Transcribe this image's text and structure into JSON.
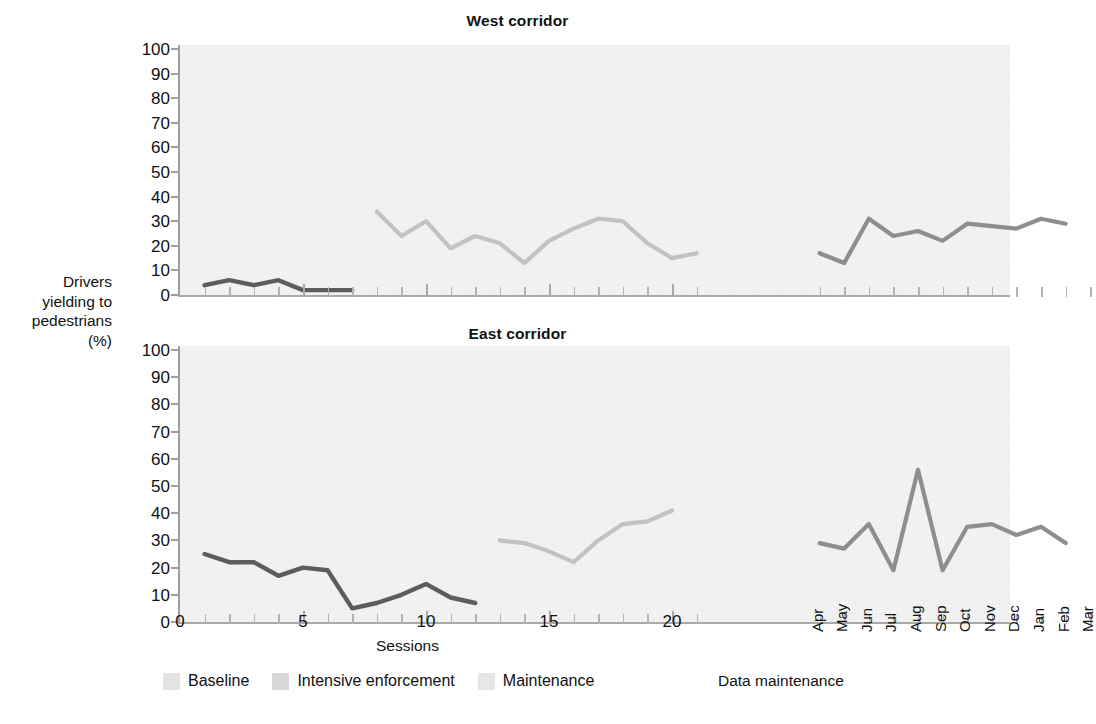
{
  "figure": {
    "y_axis_label_lines": [
      "Drivers",
      "yielding to",
      "pedestrians",
      "(%)"
    ],
    "x_axis_caption_left": "Sessions",
    "x_axis_caption_right": "Data maintenance"
  },
  "legend": {
    "items": [
      {
        "label": "Baseline",
        "color": "#5d5d5d"
      },
      {
        "label": "Intensive enforcement",
        "color": "#c2c2c2"
      },
      {
        "label": "Maintenance",
        "color": "#8e8e8e"
      }
    ],
    "swatch_colors": [
      "#e3e3e3",
      "#d8d8d8",
      "#e6e6e6"
    ]
  },
  "chart_data": [
    {
      "type": "line",
      "title": "West corridor",
      "xlabel": "Sessions",
      "ylabel": "Drivers yielding to pedestrians (%)",
      "ylim": [
        0,
        100
      ],
      "yticks": [
        0,
        10,
        20,
        30,
        40,
        50,
        60,
        70,
        80,
        90,
        100
      ],
      "xticks_session": [
        0,
        5,
        10,
        15,
        20
      ],
      "xticks_month": [
        "Apr",
        "May",
        "Jun",
        "Jul",
        "Aug",
        "Sep",
        "Oct",
        "Nov",
        "Dec",
        "Jan",
        "Feb",
        "Mar"
      ],
      "grid": false,
      "legend_position": "below-figure",
      "series": [
        {
          "name": "Baseline",
          "color": "#5d5d5d",
          "x": [
            1,
            2,
            3,
            4,
            5,
            6,
            7
          ],
          "values": [
            4,
            6,
            4,
            6,
            2,
            2,
            2
          ]
        },
        {
          "name": "Intensive enforcement",
          "color": "#c2c2c2",
          "x": [
            8,
            9,
            10,
            11,
            12,
            13,
            14,
            15,
            16,
            17,
            18,
            19,
            20,
            21
          ],
          "values": [
            34,
            24,
            30,
            19,
            24,
            21,
            13,
            22,
            27,
            31,
            30,
            21,
            15,
            17
          ]
        },
        {
          "name": "Maintenance",
          "color": "#8e8e8e",
          "x": [
            "Apr",
            "May",
            "Jun",
            "Jul",
            "Aug",
            "Sep",
            "Oct",
            "Nov",
            "Dec",
            "Jan",
            "Feb"
          ],
          "values": [
            17,
            13,
            31,
            24,
            26,
            22,
            29,
            28,
            27,
            31,
            29
          ]
        }
      ]
    },
    {
      "type": "line",
      "title": "East corridor",
      "xlabel": "Sessions",
      "ylabel": "Drivers yielding to pedestrians (%)",
      "ylim": [
        0,
        100
      ],
      "yticks": [
        0,
        10,
        20,
        30,
        40,
        50,
        60,
        70,
        80,
        90,
        100
      ],
      "xticks_session": [
        0,
        5,
        10,
        15,
        20
      ],
      "xticks_month": [
        "Apr",
        "May",
        "Jun",
        "Jul",
        "Aug",
        "Sep",
        "Oct",
        "Nov",
        "Dec",
        "Jan",
        "Feb",
        "Mar"
      ],
      "grid": false,
      "legend_position": "below-figure",
      "series": [
        {
          "name": "Baseline",
          "color": "#5d5d5d",
          "x": [
            1,
            2,
            3,
            4,
            5,
            6,
            7,
            8,
            9,
            10,
            11,
            12
          ],
          "values": [
            25,
            22,
            22,
            17,
            20,
            19,
            5,
            7,
            10,
            14,
            9,
            7
          ]
        },
        {
          "name": "Intensive enforcement",
          "color": "#c2c2c2",
          "x": [
            13,
            14,
            15,
            16,
            17,
            18,
            19,
            20
          ],
          "values": [
            30,
            29,
            26,
            22,
            30,
            36,
            37,
            41
          ]
        },
        {
          "name": "Maintenance",
          "color": "#8e8e8e",
          "x": [
            "Apr",
            "May",
            "Jun",
            "Jul",
            "Aug",
            "Sep",
            "Oct",
            "Nov",
            "Dec",
            "Jan",
            "Feb"
          ],
          "values": [
            29,
            27,
            36,
            19,
            56,
            19,
            35,
            36,
            32,
            35,
            29
          ]
        }
      ]
    }
  ]
}
